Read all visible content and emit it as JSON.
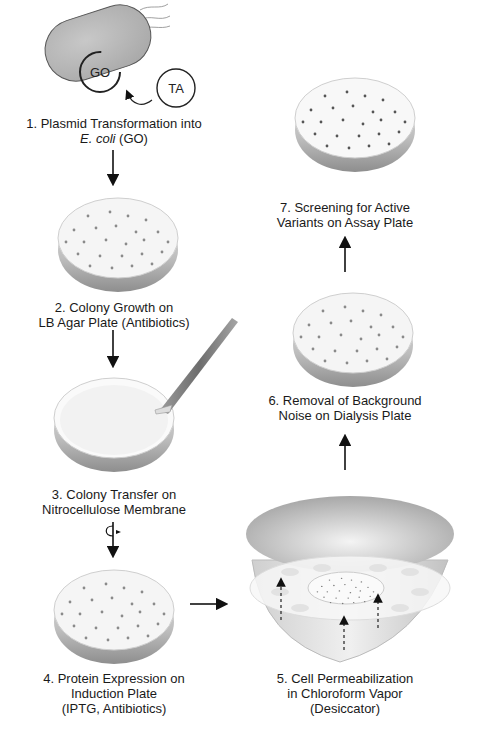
{
  "diagram": {
    "title": "",
    "steps": [
      {
        "number": "1",
        "line1": "1. Plasmid Transformation into",
        "line2_italic": "E. coli",
        "line2_rest": " (GO)"
      },
      {
        "number": "2",
        "line1": "2. Colony Growth on",
        "line2": "LB Agar Plate (Antibiotics)"
      },
      {
        "number": "3",
        "line1": "3. Colony Transfer on",
        "line2": "Nitrocellulose Membrane"
      },
      {
        "number": "4",
        "line1": "4. Protein Expression on",
        "line2": "Induction Plate",
        "line3": "(IPTG, Antibiotics)"
      },
      {
        "number": "5",
        "line1": "5. Cell Permeabilization",
        "line2": "in Chloroform Vapor",
        "line3": "(Desiccator)"
      },
      {
        "number": "6",
        "line1": "6. Removal of Background",
        "line2": "Noise on Dialysis Plate"
      },
      {
        "number": "7",
        "line1": "7. Screening for Active",
        "line2": "Variants on Assay Plate"
      }
    ],
    "plasmids": {
      "host": "GO",
      "insert": "TA"
    },
    "icons": [
      "bacterium-icon",
      "plasmid-icon",
      "petri-dish-icon",
      "tweezers-icon",
      "flip-icon",
      "desiccator-icon",
      "arrow-icon"
    ],
    "colors": {
      "ink": "#1a1a1a",
      "cell": "#b8b8b8",
      "dish": "#f4f4f4",
      "dish_rim": "#c8c8c8",
      "colony": "#7a7a7a"
    }
  }
}
